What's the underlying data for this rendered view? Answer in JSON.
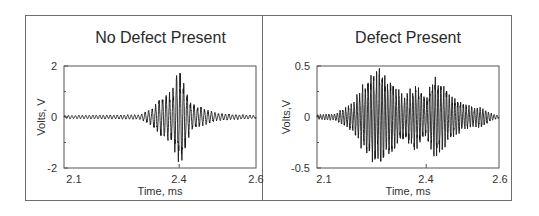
{
  "chart_data": [
    {
      "type": "line",
      "title": "No Defect Present",
      "xlabel": "Time, ms",
      "ylabel": "Volts, V",
      "xlim": [
        2.1,
        2.6
      ],
      "ylim": [
        -2,
        2
      ],
      "xticks": [
        "2.1",
        "2.4",
        "2.6"
      ],
      "yticks": [
        "2",
        "0",
        "-2"
      ],
      "grid": false,
      "legend": null,
      "series": [
        {
          "name": "No Defect Present waveform",
          "description": "Low-level noise (~±0.05 V) with a short burst centered near 2.40 ms",
          "envelope_peaks": [
            {
              "t": 2.1,
              "amp": 0.05
            },
            {
              "t": 2.3,
              "amp": 0.08
            },
            {
              "t": 2.33,
              "amp": 0.3
            },
            {
              "t": 2.36,
              "amp": 0.75
            },
            {
              "t": 2.38,
              "amp": 0.8
            },
            {
              "t": 2.4,
              "amp": 1.65
            },
            {
              "t": 2.41,
              "amp": 1.3
            },
            {
              "t": 2.43,
              "amp": 0.45
            },
            {
              "t": 2.46,
              "amp": 0.3
            },
            {
              "t": 2.5,
              "amp": 0.12
            },
            {
              "t": 2.6,
              "amp": 0.05
            }
          ],
          "max_value": 1.65,
          "min_value": -1.75,
          "approx_frequency_khz": 110
        }
      ]
    },
    {
      "type": "line",
      "title": "Defect Present",
      "xlabel": "Time, ms",
      "ylabel": "Volts,V",
      "xlim": [
        2.1,
        2.6
      ],
      "ylim": [
        -0.5,
        0.5
      ],
      "xticks": [
        "2.1",
        "2.4",
        "2.6"
      ],
      "yticks": [
        "0.5",
        "0",
        "-0.5"
      ],
      "grid": false,
      "legend": null,
      "series": [
        {
          "name": "Defect Present waveform",
          "description": "Long ringing burst with multiple beating packets from ~2.18 to ~2.58 ms",
          "envelope_peaks": [
            {
              "t": 2.1,
              "amp": 0.02
            },
            {
              "t": 2.15,
              "amp": 0.03
            },
            {
              "t": 2.2,
              "amp": 0.12
            },
            {
              "t": 2.23,
              "amp": 0.3
            },
            {
              "t": 2.26,
              "amp": 0.4
            },
            {
              "t": 2.28,
              "amp": 0.4
            },
            {
              "t": 2.31,
              "amp": 0.28
            },
            {
              "t": 2.34,
              "amp": 0.18
            },
            {
              "t": 2.37,
              "amp": 0.27
            },
            {
              "t": 2.4,
              "amp": 0.16
            },
            {
              "t": 2.42,
              "amp": 0.33
            },
            {
              "t": 2.44,
              "amp": 0.3
            },
            {
              "t": 2.47,
              "amp": 0.18
            },
            {
              "t": 2.5,
              "amp": 0.12
            },
            {
              "t": 2.53,
              "amp": 0.08
            },
            {
              "t": 2.55,
              "amp": 0.09
            },
            {
              "t": 2.58,
              "amp": 0.03
            },
            {
              "t": 2.6,
              "amp": 0.01
            }
          ],
          "max_value": 0.4,
          "min_value": -0.4,
          "approx_frequency_khz": 130
        }
      ]
    }
  ],
  "panels": {
    "left": {
      "title": "No Defect Present",
      "ylabel": "Volts, V",
      "xlabel": "Time, ms",
      "yticks": [
        "2",
        "0",
        "-2"
      ],
      "xticks": [
        "2.1",
        "2.4",
        "2.6"
      ]
    },
    "right": {
      "title": "Defect Present",
      "ylabel": "Volts,V",
      "xlabel": "Time, ms",
      "yticks": [
        "0.5",
        "0",
        "-0.5"
      ],
      "xticks": [
        "2.1",
        "2.4",
        "2.6"
      ]
    }
  },
  "colors": {
    "trace": "#1a1a1a",
    "axes": "#555555",
    "frame": "#6e6e6e",
    "text": "#2a2a2a"
  }
}
